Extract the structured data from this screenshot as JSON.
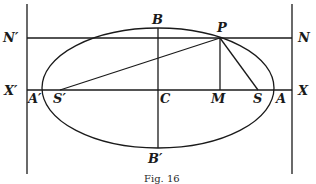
{
  "figure": {
    "caption": "Fig. 16",
    "ellipse": {
      "cx": 158,
      "cy": 88,
      "rx": 116,
      "ry": 60
    },
    "lines": {
      "left_directrix": {
        "x": 27,
        "y1": 4,
        "y2": 174
      },
      "right_directrix": {
        "x": 292,
        "y1": 4,
        "y2": 174
      },
      "NN_line": {
        "y": 38,
        "x1": 27,
        "x2": 292
      },
      "XX_axis": {
        "y": 90,
        "x1": 27,
        "x2": 292
      },
      "minor_axis": {
        "x": 158,
        "y1": 28,
        "y2": 148
      },
      "PM": {
        "x": 220,
        "y1": 38,
        "y2": 90
      },
      "PS": {
        "x1": 220,
        "y1": 38,
        "x2": 258,
        "y2": 90
      },
      "PS_prime": {
        "x1": 220,
        "y1": 38,
        "x2": 60,
        "y2": 90
      }
    },
    "labels": {
      "N_prime": "N′",
      "N": "N",
      "X_prime": "X′",
      "X": "X",
      "A_prime": "A′",
      "S_prime": "S′",
      "C": "C",
      "M": "M",
      "S": "S",
      "A": "A",
      "B": "B",
      "B_prime": "B′",
      "P": "P"
    }
  }
}
